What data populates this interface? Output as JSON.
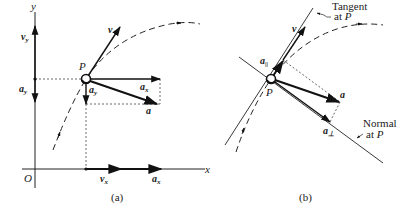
{
  "figure": {
    "panel_a": {
      "caption": "(a)",
      "axes": {
        "x_label": "x",
        "y_label": "y",
        "origin_label": "O"
      },
      "point_label": "P",
      "vectors": {
        "v": "v",
        "a": "a",
        "a_x": "a",
        "a_x_sub": "x",
        "a_y": "a",
        "a_y_sub": "y",
        "v_y": "v",
        "v_y_sub": "y",
        "v_x": "v",
        "v_x_sub": "x",
        "axis_a_y": "a",
        "axis_a_y_sub": "y",
        "axis_a_x": "a",
        "axis_a_x_sub": "x"
      }
    },
    "panel_b": {
      "caption": "(b)",
      "point_label": "P",
      "tangent_label_line1": "Tangent",
      "tangent_label_line2": "at",
      "tangent_label_P": "P",
      "normal_label_line1": "Normal",
      "normal_label_line2": "at",
      "normal_label_P": "P",
      "vectors": {
        "v": "v",
        "a": "a",
        "a_parallel": "a",
        "a_parallel_sub": "||",
        "a_perp": "a",
        "a_perp_sub": "⊥"
      }
    }
  }
}
